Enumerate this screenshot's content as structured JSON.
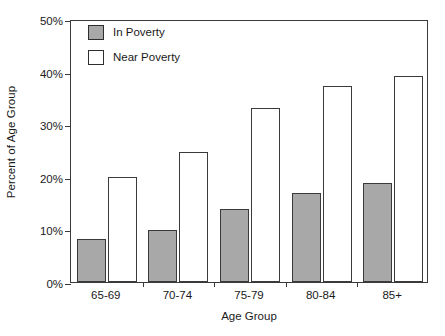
{
  "chart_data": {
    "type": "bar",
    "title": "",
    "xlabel": "Age Group",
    "ylabel": "Percent of Age Group",
    "categories": [
      "65-69",
      "70-74",
      "75-79",
      "80-84",
      "85+"
    ],
    "ylim": [
      0,
      50
    ],
    "yticks": [
      0,
      10,
      20,
      30,
      40,
      50
    ],
    "ytick_labels": [
      "0%",
      "10%",
      "20%",
      "30%",
      "40%",
      "50%"
    ],
    "grid": false,
    "legend_position": "top-left-inside",
    "series": [
      {
        "name": "In Poverty",
        "color": "#a8a8a8",
        "values": [
          8.2,
          9.9,
          13.8,
          17.0,
          18.8
        ]
      },
      {
        "name": "Near Poverty",
        "color": "#ffffff",
        "values": [
          20.0,
          24.7,
          33.0,
          37.2,
          39.1
        ]
      }
    ]
  },
  "style": {
    "axis_color": "#3a3a3a",
    "bar_edge_color": "#3a3a3a",
    "in_poverty_fill": "#a8a8a8",
    "near_poverty_fill": "#ffffff",
    "background": "#ffffff"
  }
}
